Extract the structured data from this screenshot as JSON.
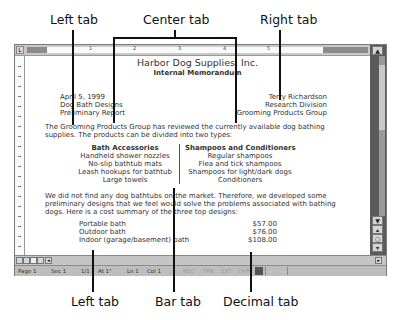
{
  "callouts": {
    "top": {
      "left_tab": "Left tab",
      "center_tab": "Center tab",
      "right_tab": "Right tab"
    },
    "bottom": {
      "left_tab": "Left tab",
      "bar_tab": "Bar tab",
      "decimal_tab": "Decimal tab"
    }
  },
  "ruler": {
    "numbers": [
      "1",
      "2",
      "3",
      "4",
      "5"
    ],
    "tab_selector_icon": "left-tab-selector"
  },
  "document": {
    "title": "Harbor Dog Supplies, Inc.",
    "subtitle": "Internal Memorandum",
    "left_header": [
      "April 5, 1999",
      "Dog Bath Designs",
      "Preliminary Report"
    ],
    "right_header": [
      "Terry Richardson",
      "Research Division",
      "Grooming Products Group"
    ],
    "intro": [
      "The Grooming Products Group has reviewed the currently available dog bathing",
      "supplies. The products can be divided into two types:"
    ],
    "col1": {
      "heading": "Bath Accessories",
      "items": [
        "Handheld shower nozzles",
        "No-slip bathtub mats",
        "Leash hookups for bathtub",
        "Large towels"
      ]
    },
    "col2": {
      "heading": "Shampoos and Conditioners",
      "items": [
        "Regular shampoos",
        "Flea and tick shampoos",
        "Shampoos for light/dark dogs",
        "Conditioners"
      ]
    },
    "para2": [
      "We did not find any dog bathtubs on the market. Therefore, we developed some",
      "preliminary designs that we feel would solve the problems associated with bathing",
      "dogs. Here is a cost summary of the three top designs:"
    ],
    "costs": [
      {
        "name": "Portable bath",
        "price": "$57.00"
      },
      {
        "name": "Outdoor bath",
        "price": "$76.00"
      },
      {
        "name": "Indoor (garage/basement) bath",
        "price": "$108.00"
      }
    ]
  },
  "status_bar": {
    "page": "Page 1",
    "sec": "Sec 1",
    "page_of": "1/1",
    "at": "At 1\"",
    "ln": "Ln 1",
    "col": "Col 1",
    "rec": "REC",
    "trk": "TRK",
    "ext": "EXT",
    "ovr": "OVR"
  },
  "scrollbar": {
    "up": "▲",
    "down": "▼",
    "prev_page": "▴",
    "select_browse": "○",
    "next_page": "▾",
    "left": "◂",
    "right": "▸"
  }
}
